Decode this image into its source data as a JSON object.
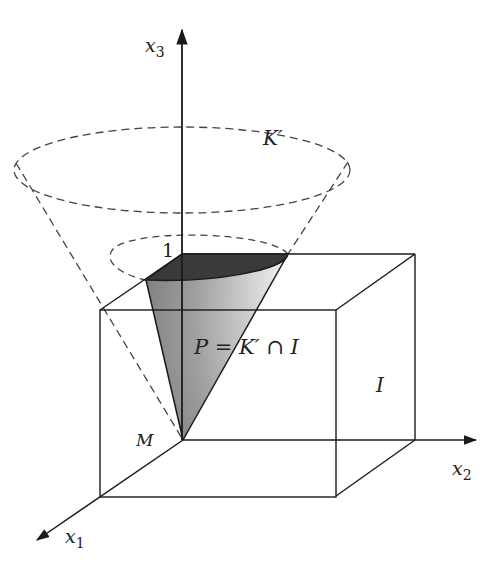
{
  "figure": {
    "type": "3D geometric diagram",
    "colors": {
      "line": "#1a1a1a",
      "dashed": "#444444",
      "shade_dark": "#3a3a3a",
      "shade_mid": "#8a8a8a",
      "shade_light": "#f2f2f2"
    }
  },
  "axes": {
    "x1": {
      "name": "x",
      "subscript": "1"
    },
    "x2": {
      "name": "x",
      "subscript": "2"
    },
    "x3": {
      "name": "x",
      "subscript": "3"
    }
  },
  "labels": {
    "cone": "K′",
    "intersection": "P = K′ ∩ I",
    "box": "I",
    "origin": "M",
    "unit_height": "1"
  }
}
